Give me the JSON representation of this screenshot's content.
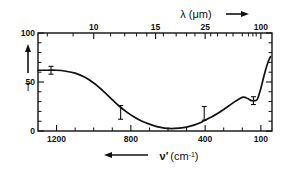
{
  "chart_data": {
    "type": "line",
    "title": "",
    "xlabel": "ν̃ (cm⁻¹)",
    "xlabel_parts": {
      "symbol": "ν",
      "prime": "′",
      "unit": "(cm",
      "exponent": "-1",
      "unit_close": ")"
    },
    "xlabel_arrow": "←",
    "ylabel": "T",
    "ylabel_arrow": "↑",
    "top_xlabel": "λ (μm)",
    "top_xlabel_arrow": "→",
    "xlim": [
      1300,
      40
    ],
    "ylim": [
      0,
      100
    ],
    "x_ticklabels": [
      "1200",
      "800",
      "400",
      "100"
    ],
    "x_tickvalues": [
      1200,
      800,
      400,
      100
    ],
    "x_minor_tickvalues": [
      1100,
      1000,
      900,
      700,
      600,
      500,
      300,
      200
    ],
    "y_ticklabels": [
      "0",
      "50",
      "100"
    ],
    "y_tickvalues": [
      0,
      50,
      100
    ],
    "y_minor_tickvalues": [
      10,
      20,
      30,
      40,
      60,
      70,
      80,
      90
    ],
    "top_ticklabels": [
      "10",
      "15",
      "25",
      "100"
    ],
    "top_tickvalues_wavelength": [
      10,
      15,
      25,
      100
    ],
    "top_tickvalues_wavenumber": [
      1000,
      667,
      400,
      100
    ],
    "top_minor_tickvalues_wavenumber": [
      1250,
      1111,
      909,
      833,
      769,
      714,
      625,
      556,
      500,
      455,
      370,
      333,
      286,
      250,
      200,
      167,
      143,
      125
    ],
    "grid": false,
    "legend": null,
    "series": [
      {
        "name": "Transmission",
        "x": [
          1300,
          1250,
          1200,
          1150,
          1100,
          1050,
          1000,
          950,
          900,
          860,
          820,
          780,
          740,
          700,
          660,
          620,
          580,
          540,
          500,
          460,
          420,
          380,
          340,
          300,
          270,
          240,
          215,
          195,
          180,
          165,
          150,
          135,
          120,
          105,
          90,
          75,
          60,
          48
        ],
        "y": [
          62,
          62,
          62,
          61,
          59,
          55,
          49,
          41,
          32,
          25,
          19,
          14,
          10,
          7,
          4.5,
          3,
          2.5,
          3,
          4,
          6,
          9,
          13,
          17,
          22,
          26,
          30,
          33,
          34.5,
          34,
          32.5,
          31,
          31,
          32,
          40,
          51,
          62,
          71,
          76
        ]
      }
    ],
    "error_bars": [
      {
        "x": 1230,
        "y": 62,
        "yerr": 4
      },
      {
        "x": 855,
        "y": 19,
        "yerr": 7
      },
      {
        "x": 405,
        "y": 18,
        "yerr": 7
      },
      {
        "x": 140,
        "y": 31,
        "yerr": 4
      }
    ],
    "colors": {
      "curve": "#111111",
      "axis": "#111111",
      "background": "#ffffff"
    }
  },
  "figure": {
    "caption": ""
  }
}
